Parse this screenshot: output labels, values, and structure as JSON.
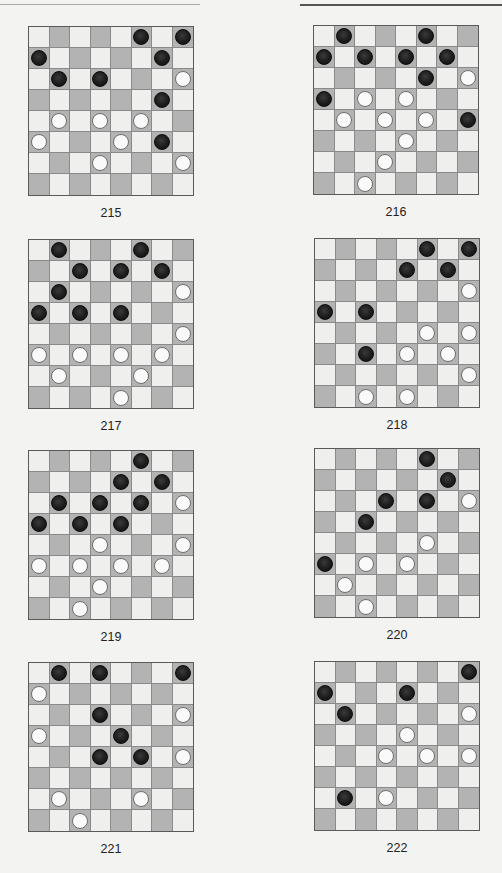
{
  "page": {
    "background": "#f3f3f1",
    "colors": {
      "light_square": "#efefee",
      "dark_square": "#b3b3b3",
      "black_piece": "#1c1c1c",
      "white_piece": "#fafafa"
    }
  },
  "diagrams": [
    {
      "number": "215",
      "pos": {
        "left": 28,
        "top": 26
      },
      "black": [
        [
          0,
          5
        ],
        [
          0,
          7
        ],
        [
          1,
          0
        ],
        [
          1,
          6
        ],
        [
          2,
          1
        ],
        [
          2,
          3
        ],
        [
          3,
          6
        ],
        [
          5,
          6
        ]
      ],
      "white": [
        [
          2,
          7
        ],
        [
          4,
          1
        ],
        [
          4,
          3
        ],
        [
          4,
          5
        ],
        [
          5,
          0
        ],
        [
          5,
          4
        ],
        [
          6,
          3
        ],
        [
          6,
          7
        ]
      ]
    },
    {
      "number": "216",
      "pos": {
        "left": 313,
        "top": 25
      },
      "black": [
        [
          0,
          1
        ],
        [
          0,
          5
        ],
        [
          1,
          0
        ],
        [
          1,
          2
        ],
        [
          1,
          4
        ],
        [
          1,
          6
        ],
        [
          2,
          5
        ],
        [
          3,
          0
        ],
        [
          4,
          7
        ]
      ],
      "white": [
        [
          2,
          7
        ],
        [
          3,
          2
        ],
        [
          3,
          4
        ],
        [
          4,
          1
        ],
        [
          4,
          3
        ],
        [
          4,
          5
        ],
        [
          5,
          4
        ],
        [
          6,
          3
        ],
        [
          7,
          2
        ]
      ]
    },
    {
      "number": "217",
      "pos": {
        "left": 28,
        "top": 239
      },
      "black": [
        [
          0,
          1
        ],
        [
          0,
          5
        ],
        [
          1,
          2
        ],
        [
          1,
          4
        ],
        [
          1,
          6
        ],
        [
          2,
          1
        ],
        [
          3,
          0
        ],
        [
          3,
          2
        ],
        [
          3,
          4
        ]
      ],
      "white": [
        [
          2,
          7
        ],
        [
          4,
          7
        ],
        [
          5,
          0
        ],
        [
          5,
          2
        ],
        [
          5,
          4
        ],
        [
          5,
          6
        ],
        [
          6,
          1
        ],
        [
          6,
          5
        ],
        [
          7,
          4
        ]
      ]
    },
    {
      "number": "218",
      "pos": {
        "left": 314,
        "top": 238
      },
      "black": [
        [
          0,
          5
        ],
        [
          0,
          7
        ],
        [
          1,
          4
        ],
        [
          1,
          6
        ],
        [
          3,
          0
        ],
        [
          3,
          2
        ],
        [
          5,
          2
        ]
      ],
      "white": [
        [
          2,
          7
        ],
        [
          4,
          5
        ],
        [
          4,
          7
        ],
        [
          5,
          4
        ],
        [
          5,
          6
        ],
        [
          6,
          7
        ],
        [
          7,
          2
        ],
        [
          7,
          4
        ]
      ]
    },
    {
      "number": "219",
      "pos": {
        "left": 28,
        "top": 450
      },
      "black": [
        [
          0,
          5
        ],
        [
          1,
          4
        ],
        [
          1,
          6
        ],
        [
          2,
          1
        ],
        [
          2,
          3
        ],
        [
          2,
          5
        ],
        [
          3,
          0
        ],
        [
          3,
          2
        ],
        [
          3,
          4
        ]
      ],
      "white": [
        [
          2,
          7
        ],
        [
          4,
          3
        ],
        [
          4,
          7
        ],
        [
          5,
          0
        ],
        [
          5,
          2
        ],
        [
          5,
          4
        ],
        [
          5,
          6
        ],
        [
          6,
          3
        ],
        [
          7,
          2
        ]
      ]
    },
    {
      "number": "220",
      "pos": {
        "left": 314,
        "top": 448
      },
      "black": [
        [
          0,
          5
        ],
        [
          1,
          6
        ],
        [
          2,
          3
        ],
        [
          2,
          5
        ],
        [
          3,
          2
        ],
        [
          5,
          0
        ]
      ],
      "white": [
        [
          2,
          7
        ],
        [
          4,
          5
        ],
        [
          5,
          2
        ],
        [
          5,
          4
        ],
        [
          6,
          1
        ],
        [
          7,
          2
        ]
      ]
    },
    {
      "number": "221",
      "pos": {
        "left": 28,
        "top": 662
      },
      "black": [
        [
          0,
          1
        ],
        [
          0,
          3
        ],
        [
          0,
          7
        ],
        [
          2,
          3
        ],
        [
          3,
          4
        ],
        [
          4,
          3
        ],
        [
          4,
          5
        ]
      ],
      "white": [
        [
          1,
          0
        ],
        [
          2,
          7
        ],
        [
          3,
          0
        ],
        [
          4,
          7
        ],
        [
          6,
          1
        ],
        [
          6,
          5
        ],
        [
          7,
          2
        ]
      ]
    },
    {
      "number": "222",
      "pos": {
        "left": 314,
        "top": 661
      },
      "black": [
        [
          0,
          7
        ],
        [
          1,
          0
        ],
        [
          1,
          4
        ],
        [
          2,
          1
        ],
        [
          6,
          1
        ]
      ],
      "white": [
        [
          2,
          7
        ],
        [
          3,
          4
        ],
        [
          4,
          3
        ],
        [
          4,
          5
        ],
        [
          4,
          7
        ],
        [
          6,
          3
        ]
      ]
    }
  ]
}
